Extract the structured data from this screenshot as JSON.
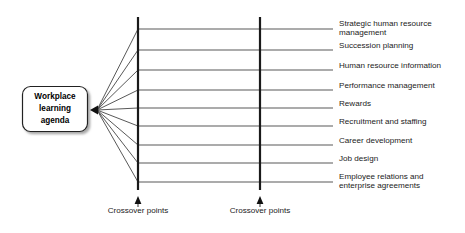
{
  "diagram": {
    "type": "fan-out-crossover-diagram",
    "background_color": "#ffffff",
    "line_color": "#3a3a3a",
    "bar_color": "#1a1a1a",
    "text_color": "#1b1b1b",
    "source": {
      "name": "workplace-learning-agenda-box",
      "text_lines": [
        "Workplace",
        "learning",
        "agenda"
      ],
      "full_text": "Workplace learning agenda",
      "shape": "rounded-rectangle",
      "has_shadow": true,
      "fill_color": "#ffffff",
      "border_color": "#222222"
    },
    "arrowhead": {
      "name": "convergence-arrowhead",
      "direction": "left",
      "x": 92,
      "y": 110
    },
    "crossover_bars": [
      {
        "label": "Crossover points",
        "x": 138,
        "top": 17,
        "bottom": 190
      },
      {
        "label": "Crossover points",
        "x": 260,
        "top": 17,
        "bottom": 190
      }
    ],
    "branches": [
      {
        "index": 1,
        "label": "Strategic human resource management",
        "label_lines": [
          "Strategic human resource",
          "management"
        ],
        "y": 29
      },
      {
        "index": 2,
        "label": "Succession planning",
        "label_lines": [
          "Succession planning"
        ],
        "y": 50
      },
      {
        "index": 3,
        "label": "Human resource information",
        "label_lines": [
          "Human resource information"
        ],
        "y": 70
      },
      {
        "index": 4,
        "label": "Performance management",
        "label_lines": [
          "Performance management"
        ],
        "y": 90
      },
      {
        "index": 5,
        "label": "Rewards",
        "label_lines": [
          "Rewards"
        ],
        "y": 108
      },
      {
        "index": 6,
        "label": "Recruitment and staffing",
        "label_lines": [
          "Recruitment and staffing"
        ],
        "y": 126
      },
      {
        "index": 7,
        "label": "Career development",
        "label_lines": [
          "Career development"
        ],
        "y": 145
      },
      {
        "index": 8,
        "label": "Job design",
        "label_lines": [
          "Job design"
        ],
        "y": 163
      },
      {
        "index": 9,
        "label": "Employee relations and enterprise agreements",
        "label_lines": [
          "Employee relations and",
          "enterprise agreements"
        ],
        "y": 182
      }
    ],
    "geometry": {
      "line_end_x": 333,
      "label_start_x": 339,
      "crossover_label_y": 213,
      "crossover_arrow_tip_y": 196,
      "crossover_arrow_base_y": 204,
      "crossover_stem_bottom_y": 207
    }
  }
}
